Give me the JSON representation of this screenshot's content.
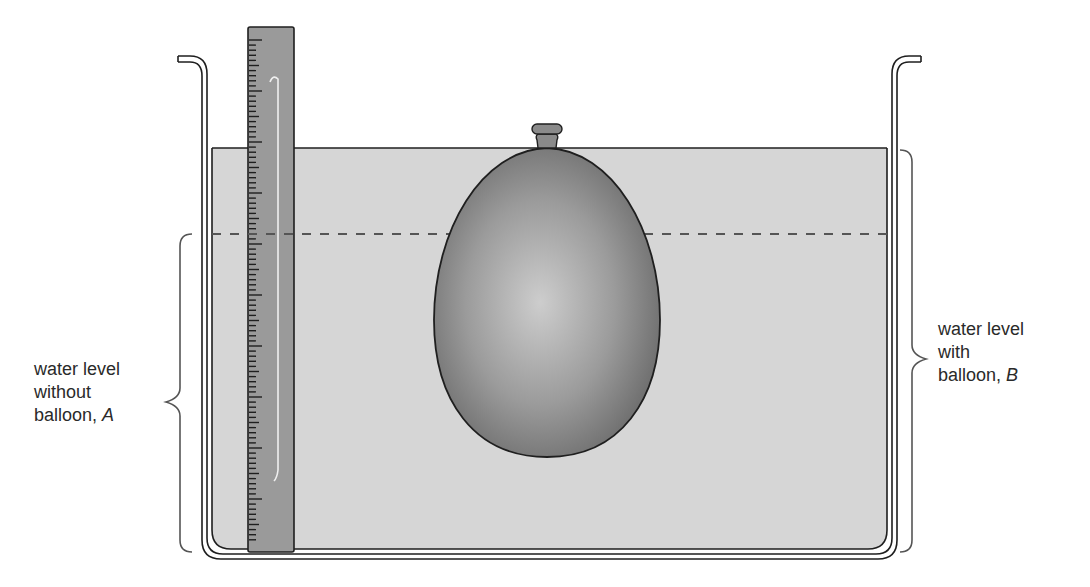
{
  "diagram": {
    "colors": {
      "outline": "#1f1f1f",
      "water": "#d6d6d6",
      "ruler": "#9a9a9a",
      "balloon_dark": "#6f6f6f",
      "balloon_light": "#c9c9c9",
      "dashed_line": "#555555",
      "text": "#2a2a2a"
    },
    "components": [
      {
        "id": "tank",
        "name": "tank"
      },
      {
        "id": "water",
        "name": "water"
      },
      {
        "id": "ruler",
        "name": "ruler"
      },
      {
        "id": "balloon",
        "name": "balloon (submerged, tied at top)"
      },
      {
        "id": "level-without",
        "name": "dashed line: water level without balloon"
      },
      {
        "id": "level-with",
        "name": "solid line: water level with balloon"
      }
    ],
    "labels": {
      "a": {
        "line1": "water level",
        "line2": "without",
        "line3_prefix": "balloon, ",
        "variable": "A"
      },
      "b": {
        "line1": "water level",
        "line2": "with",
        "line3_prefix": "balloon, ",
        "variable": "B"
      }
    }
  }
}
